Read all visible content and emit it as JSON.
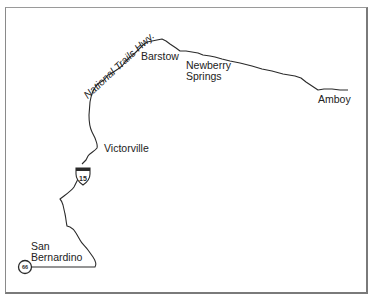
{
  "map": {
    "road_name": "National Trails Hwy.",
    "places": [
      {
        "name": "Barstow"
      },
      {
        "name": "Newberry Springs",
        "line1": "Newberry",
        "line2": "Springs"
      },
      {
        "name": "Amboy"
      },
      {
        "name": "Victorville"
      },
      {
        "name": "San Bernardino",
        "line1": "San",
        "line2": "Bernardino"
      }
    ],
    "shields": {
      "interstate": {
        "number": "15",
        "type": "interstate-shield"
      },
      "route66": {
        "number": "66",
        "type": "us-route-circle"
      }
    },
    "colors": {
      "line": "#2a2a2a",
      "frame": "#7a7a7a",
      "background": "#ffffff"
    }
  }
}
